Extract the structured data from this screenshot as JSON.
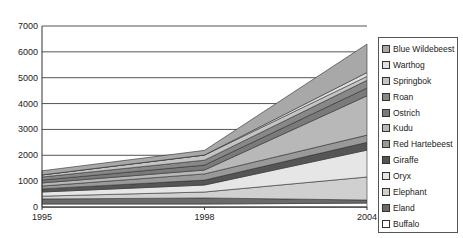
{
  "chart_data": {
    "type": "area",
    "stacked": true,
    "title": "",
    "xlabel": "",
    "ylabel": "",
    "x": [
      "1995",
      "1998",
      "2004"
    ],
    "ylim": [
      0,
      7000
    ],
    "yticks": [
      0,
      1000,
      2000,
      3000,
      4000,
      5000,
      6000,
      7000
    ],
    "grid": true,
    "legend_position": "right",
    "series": [
      {
        "name": "Buffalo",
        "values": [
          115,
          115,
          150
        ],
        "color": "#ffffff"
      },
      {
        "name": "Eland",
        "values": [
          195,
          235,
          120
        ],
        "color": "#6a6a6a"
      },
      {
        "name": "Elephant",
        "values": [
          110,
          230,
          890
        ],
        "color": "#d0d0d0"
      },
      {
        "name": "Oryx",
        "values": [
          160,
          270,
          1040
        ],
        "color": "#e6e6e6"
      },
      {
        "name": "Giraffe",
        "values": [
          120,
          190,
          300
        ],
        "color": "#555555"
      },
      {
        "name": "Red Hartebeest",
        "values": [
          110,
          240,
          280
        ],
        "color": "#999999"
      },
      {
        "name": "Kudu",
        "values": [
          120,
          150,
          1520
        ],
        "color": "#b8b8b8"
      },
      {
        "name": "Ostrich",
        "values": [
          110,
          190,
          300
        ],
        "color": "#7a7a7a"
      },
      {
        "name": "Roan",
        "values": [
          120,
          190,
          300
        ],
        "color": "#888888"
      },
      {
        "name": "Springbok",
        "values": [
          80,
          200,
          150
        ],
        "color": "#c4c4c4"
      },
      {
        "name": "Warthog",
        "values": [
          0,
          0,
          150
        ],
        "color": "#e0e0e0"
      },
      {
        "name": "Blue Wildebeest",
        "values": [
          160,
          180,
          1100
        ],
        "color": "#a8a8a8"
      }
    ]
  },
  "legend": {
    "items": [
      {
        "label": "Blue Wildebeest",
        "color": "#a8a8a8"
      },
      {
        "label": "Warthog",
        "color": "#e0e0e0"
      },
      {
        "label": "Springbok",
        "color": "#c4c4c4"
      },
      {
        "label": "Roan",
        "color": "#888888"
      },
      {
        "label": "Ostrich",
        "color": "#7a7a7a"
      },
      {
        "label": "Kudu",
        "color": "#b8b8b8"
      },
      {
        "label": "Red Hartebeest",
        "color": "#999999"
      },
      {
        "label": "Giraffe",
        "color": "#555555"
      },
      {
        "label": "Oryx",
        "color": "#e6e6e6"
      },
      {
        "label": "Elephant",
        "color": "#d0d0d0"
      },
      {
        "label": "Eland",
        "color": "#6a6a6a"
      },
      {
        "label": "Buffalo",
        "color": "#ffffff"
      }
    ]
  }
}
